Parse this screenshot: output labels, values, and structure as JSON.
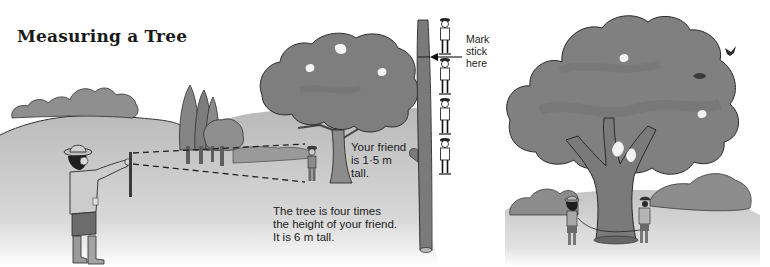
{
  "page": {
    "title": "Measuring a Tree"
  },
  "captions": {
    "mark_stick": [
      "Mark",
      "stick",
      "here"
    ],
    "friend_height": [
      "Your friend",
      "is 1·5 m",
      "tall."
    ],
    "tree_height": [
      "The tree is four times",
      "the height of your friend.",
      "It is 6 m tall."
    ]
  },
  "illustration": {
    "style": "greyscale watercolor",
    "scenes": [
      {
        "id": "sighting-scene",
        "description": "Person holding stick at arm's length, sighting friend standing by tree with dashed sight lines"
      },
      {
        "id": "stick-scale",
        "description": "Vertical stick with four stacked friend figures and arrow marking stick"
      },
      {
        "id": "girth-scene",
        "description": "Two people measuring tree trunk circumference with a string"
      }
    ],
    "colors": {
      "ground": "#c9c9c9",
      "foliage": "#8a8a8a",
      "foliage_dark": "#6e6e6e",
      "trunk": "#7a7a7a",
      "outline": "#2a2a2a"
    },
    "values": {
      "friend_height_m": 1.5,
      "multiplier": 4,
      "tree_height_m": 6
    }
  }
}
